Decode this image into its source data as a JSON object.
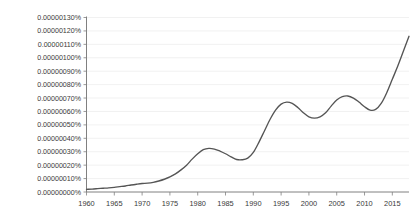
{
  "chart_data": {
    "type": "line",
    "title": "",
    "subtitle": "",
    "xlabel": "",
    "ylabel": "",
    "grid": true,
    "legend": null,
    "legend_position": "none",
    "line_color": "#555555",
    "grid_color": "#ededed",
    "axis_color": "#808080",
    "xlim": [
      1960,
      2018
    ],
    "ylim": [
      0.0,
      1.3e-08
    ],
    "y_tick_labels": [
      "0.00000000%",
      "0.00000010%",
      "0.00000020%",
      "0.00000030%",
      "0.00000040%",
      "0.00000050%",
      "0.00000060%",
      "0.00000070%",
      "0.00000080%",
      "0.00000090%",
      "0.00000100%",
      "0.00000110%",
      "0.00000120%",
      "0.00000130%"
    ],
    "y_tick_values": [
      0,
      1,
      2,
      3,
      4,
      5,
      6,
      7,
      8,
      9,
      10,
      11,
      12,
      13
    ],
    "x_tick_labels": [
      "1960",
      "1965",
      "1970",
      "1975",
      "1980",
      "1985",
      "1990",
      "1995",
      "2000",
      "2005",
      "2010",
      "2015"
    ],
    "x_tick_values": [
      1960,
      1965,
      1970,
      1975,
      1980,
      1985,
      1990,
      1995,
      2000,
      2005,
      2010,
      2015
    ],
    "x": [
      1960,
      1961,
      1962,
      1963,
      1964,
      1965,
      1966,
      1967,
      1968,
      1969,
      1970,
      1971,
      1972,
      1973,
      1974,
      1975,
      1976,
      1977,
      1978,
      1979,
      1980,
      1981,
      1982,
      1983,
      1984,
      1985,
      1986,
      1987,
      1988,
      1989,
      1990,
      1991,
      1992,
      1993,
      1994,
      1995,
      1996,
      1997,
      1998,
      1999,
      2000,
      2001,
      2002,
      2003,
      2004,
      2005,
      2006,
      2007,
      2008,
      2009,
      2010,
      2011,
      2012,
      2013,
      2014,
      2015,
      2016,
      2017,
      2018
    ],
    "values": [
      0.2,
      0.22,
      0.25,
      0.28,
      0.31,
      0.35,
      0.4,
      0.45,
      0.52,
      0.58,
      0.63,
      0.66,
      0.72,
      0.82,
      0.95,
      1.12,
      1.35,
      1.65,
      2.0,
      2.45,
      2.85,
      3.15,
      3.25,
      3.2,
      3.05,
      2.85,
      2.62,
      2.42,
      2.4,
      2.52,
      2.95,
      3.7,
      4.55,
      5.4,
      6.1,
      6.55,
      6.7,
      6.6,
      6.3,
      5.9,
      5.6,
      5.5,
      5.6,
      5.9,
      6.4,
      6.85,
      7.1,
      7.15,
      7.0,
      6.7,
      6.35,
      6.1,
      6.15,
      6.6,
      7.4,
      8.4,
      9.4,
      10.5,
      11.6
    ],
    "value_unit": "1e-9 percent",
    "value_note": "values expressed in units of 0.00000001%"
  }
}
